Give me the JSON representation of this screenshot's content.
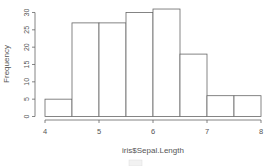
{
  "chart_data": {
    "type": "bar",
    "subtype": "histogram",
    "title": "",
    "xlabel": "iris$Sepal.Length",
    "ylabel": "Frequency",
    "bins": [
      {
        "start": 4.0,
        "end": 4.5,
        "count": 5
      },
      {
        "start": 4.5,
        "end": 5.0,
        "count": 27
      },
      {
        "start": 5.0,
        "end": 5.5,
        "count": 27
      },
      {
        "start": 5.5,
        "end": 6.0,
        "count": 30
      },
      {
        "start": 6.0,
        "end": 6.5,
        "count": 31
      },
      {
        "start": 6.5,
        "end": 7.0,
        "count": 18
      },
      {
        "start": 7.0,
        "end": 7.5,
        "count": 6
      },
      {
        "start": 7.5,
        "end": 8.0,
        "count": 6
      }
    ],
    "categories": [
      "4-4.5",
      "4.5-5",
      "5-5.5",
      "5.5-6",
      "6-6.5",
      "6.5-7",
      "7-7.5",
      "7.5-8"
    ],
    "values": [
      5,
      27,
      27,
      30,
      31,
      18,
      6,
      6
    ],
    "xlim": [
      4,
      8
    ],
    "ylim": [
      0,
      31
    ],
    "x_ticks": [
      4,
      5,
      6,
      7,
      8
    ],
    "y_ticks": [
      0,
      5,
      10,
      15,
      20,
      25,
      30
    ],
    "grid": false,
    "legend": null,
    "bar_fill": "#ffffff",
    "bar_stroke": "#666666"
  }
}
